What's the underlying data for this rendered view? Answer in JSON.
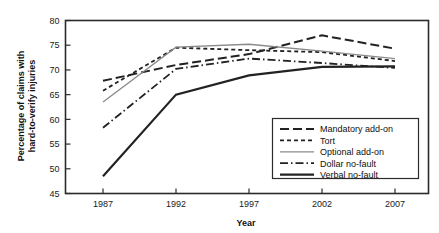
{
  "chart_data": {
    "type": "line",
    "title": "",
    "xlabel": "Year",
    "ylabel": "Percentage of claims with hard-to-verify injuries",
    "x": [
      1987,
      1992,
      1997,
      2002,
      2007
    ],
    "xtick_labels": [
      "1987",
      "1992",
      "1997",
      "2002",
      "2007"
    ],
    "ytick_labels": [
      "45",
      "50",
      "55",
      "60",
      "65",
      "70",
      "75",
      "80"
    ],
    "ylim": [
      45,
      80
    ],
    "yticks": [
      45,
      50,
      55,
      60,
      65,
      70,
      75,
      80
    ],
    "grid": false,
    "legend_position": "lower right",
    "series": [
      {
        "name": "Mandatory add-on",
        "values": [
          67.8,
          71.0,
          73.2,
          77.0,
          74.3
        ],
        "style": "long-dash",
        "color": "#222222",
        "width": 2.0,
        "dash": "9,4"
      },
      {
        "name": "Tort",
        "values": [
          65.8,
          74.5,
          74.0,
          73.6,
          71.8
        ],
        "style": "short-dash",
        "color": "#222222",
        "width": 1.8,
        "dash": "4,3"
      },
      {
        "name": "Optional add-on",
        "values": [
          63.5,
          74.6,
          75.2,
          73.8,
          72.3
        ],
        "style": "solid-thin",
        "color": "#8a8a8a",
        "width": 1.3,
        "dash": "none"
      },
      {
        "name": "Dollar no-fault",
        "values": [
          58.3,
          70.2,
          72.3,
          71.4,
          70.4
        ],
        "style": "dash-dot",
        "color": "#222222",
        "width": 1.8,
        "dash": "8,3,1.5,3"
      },
      {
        "name": "Verbal no-fault",
        "values": [
          48.5,
          65.0,
          68.9,
          70.6,
          70.7
        ],
        "style": "solid-thick",
        "color": "#222222",
        "width": 2.2,
        "dash": "none"
      }
    ]
  }
}
